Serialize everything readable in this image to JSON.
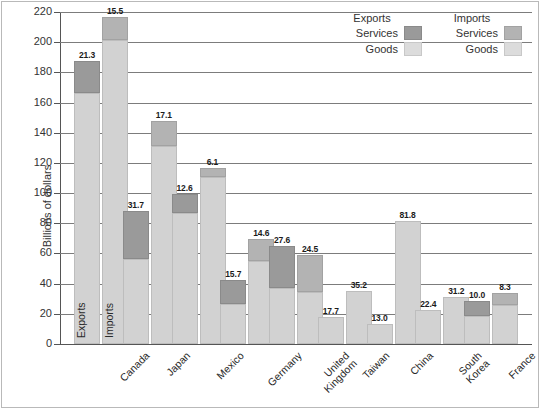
{
  "chart_data": {
    "type": "bar",
    "subtype": "grouped-stacked",
    "title": "",
    "xlabel": "",
    "ylabel": "Billions of dollars",
    "ylim": [
      0,
      220
    ],
    "ytick_step": 20,
    "yticks": [
      "220",
      "200",
      "180",
      "160",
      "140",
      "120",
      "100",
      "80",
      "60",
      "40",
      "20",
      "0"
    ],
    "grid": true,
    "legend_position": "top-right",
    "categories": [
      "Canada",
      "Japan",
      "Mexico",
      "Germany",
      "United Kingdom",
      "Taiwan",
      "China",
      "South Korea",
      "France"
    ],
    "category_lines": [
      [
        "Canada"
      ],
      [
        "Japan"
      ],
      [
        "Mexico"
      ],
      [
        "Germany"
      ],
      [
        "United",
        "Kingdom"
      ],
      [
        "Taiwan"
      ],
      [
        "China"
      ],
      [
        "South",
        "Korea"
      ],
      [
        "France"
      ]
    ],
    "series": [
      {
        "name": "Exports Goods",
        "values": [
          166.5,
          56.4,
          86.6,
          26.6,
          37.3,
          17.7,
          13.0,
          22.4,
          18.5
        ]
      },
      {
        "name": "Exports Services",
        "values": [
          21.3,
          31.7,
          12.6,
          15.7,
          27.6,
          null,
          null,
          null,
          10.0
        ]
      },
      {
        "name": "Imports Goods",
        "values": [
          201.3,
          130.9,
          110.6,
          55.2,
          34.6,
          35.2,
          81.8,
          31.2,
          25.7
        ]
      },
      {
        "name": "Imports Services",
        "values": [
          15.5,
          17.1,
          6.1,
          14.6,
          24.5,
          null,
          null,
          null,
          8.3
        ]
      }
    ],
    "bar_labels": {
      "exports_goods": [
        "166.5",
        "56.4",
        "86.6",
        "26.6",
        "37.3",
        "17.7",
        "13.0",
        "22.4",
        "18.5"
      ],
      "exports_services": [
        "21.3",
        "31.7",
        "12.6",
        "15.7",
        "27.6",
        "",
        "",
        "",
        "10.0"
      ],
      "imports_goods": [
        "201.3",
        "130.9",
        "110.6",
        "55.2",
        "34.6",
        "35.2",
        "81.8",
        "31.2",
        "25.7"
      ],
      "imports_services": [
        "15.5",
        "17.1",
        "6.1",
        "14.6",
        "24.5",
        "",
        "",
        "",
        "8.3"
      ]
    },
    "in_bar_labels": {
      "exports": "Exports",
      "imports": "Imports"
    },
    "colors": {
      "exports_services": "#9a9a9a",
      "imports_services": "#b3b3b3",
      "goods": "#d2d2d2",
      "gridline": "#7c7c7c",
      "text": "#2a2a2a"
    }
  },
  "legend": {
    "exports_header": "Exports",
    "imports_header": "Imports",
    "services_label": "Services",
    "goods_label": "Goods"
  }
}
